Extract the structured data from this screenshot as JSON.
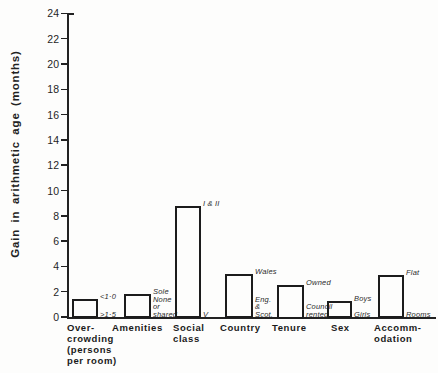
{
  "figure": {
    "background": "#fdfdfc",
    "ink_color": "#1c1c1c"
  },
  "chart_data": {
    "type": "bar",
    "title": "",
    "xlabel": "",
    "ylabel": "Gain in arithmetic age (months)",
    "ylim": [
      0,
      24
    ],
    "ytick_step": 2,
    "yticks": [
      24,
      22,
      20,
      18,
      16,
      14,
      12,
      10,
      8,
      6,
      4,
      2,
      0
    ],
    "grid": false,
    "legend": "none",
    "bar_style": "open-outline",
    "categories": [
      "Over-crowding (persons per room)",
      "Amenities",
      "Social class",
      "Country",
      "Tenure",
      "Sex",
      "Accomm-odation"
    ],
    "values": [
      1.4,
      1.8,
      8.8,
      3.4,
      2.5,
      1.3,
      3.3
    ],
    "bars": [
      {
        "category_lines": [
          "Over-",
          "crowding",
          "(persons",
          "per room)"
        ],
        "value": 1.4,
        "top_label_lines": [
          "<1·0"
        ],
        "bottom_label_lines": [
          ">1·5"
        ]
      },
      {
        "category_lines": [
          "Amenities"
        ],
        "value": 1.8,
        "top_label_lines": [
          "Sole"
        ],
        "bottom_label_lines": [
          "None",
          "or",
          "shared"
        ]
      },
      {
        "category_lines": [
          "Social",
          "class"
        ],
        "value": 8.8,
        "top_label_lines": [
          "I & II"
        ],
        "bottom_label_lines": [
          "V"
        ]
      },
      {
        "category_lines": [
          "Country"
        ],
        "value": 3.4,
        "top_label_lines": [
          "Wales"
        ],
        "bottom_label_lines": [
          "Eng.",
          "&",
          "Scot."
        ]
      },
      {
        "category_lines": [
          "Tenure"
        ],
        "value": 2.5,
        "top_label_lines": [
          "Owned"
        ],
        "bottom_label_lines": [
          "Council",
          "rented"
        ]
      },
      {
        "category_lines": [
          "Sex"
        ],
        "value": 1.3,
        "top_label_lines": [
          "Boys"
        ],
        "bottom_label_lines": [
          "Girls"
        ]
      },
      {
        "category_lines": [
          "Accomm-",
          "odation"
        ],
        "value": 3.3,
        "top_label_lines": [
          "Flat"
        ],
        "bottom_label_lines": [
          "Rooms"
        ]
      }
    ]
  }
}
